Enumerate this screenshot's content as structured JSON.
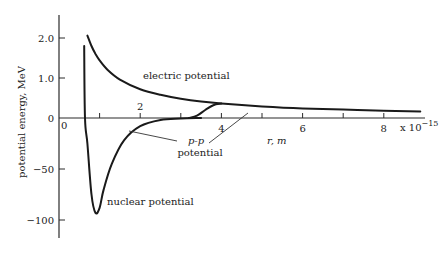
{
  "chart_data": {
    "type": "line",
    "title": "",
    "xlabel": "r, m",
    "x_multiplier": "x 10",
    "x_multiplier_exp": "−15",
    "ylabel": "potential energy, MeV",
    "xlim": [
      0,
      9
    ],
    "x_ticks": [
      1,
      2,
      3,
      4,
      5,
      6,
      7,
      8
    ],
    "x_tick_labels": [
      {
        "value": 0,
        "label": "0"
      },
      {
        "value": 2,
        "label": "2"
      },
      {
        "value": 4,
        "label": "4"
      },
      {
        "value": 6,
        "label": "6"
      },
      {
        "value": 8,
        "label": "8"
      }
    ],
    "y_axis_note": "Broken scale: upper part (0 to 2.0 MeV) expanded, lower part (0 to -100 MeV) compressed",
    "y_ticks_upper": [
      {
        "value": 2.0,
        "label": "2.0"
      },
      {
        "value": 1.0,
        "label": "1.0"
      },
      {
        "value": 0,
        "label": "0"
      }
    ],
    "y_ticks_lower": [
      {
        "value": -50,
        "label": "−50"
      },
      {
        "value": -100,
        "label": "−100"
      }
    ],
    "grid": false,
    "series": [
      {
        "name": "electric potential",
        "x": [
          0.7,
          0.8,
          0.9,
          1.0,
          1.2,
          1.5,
          2.0,
          2.5,
          3.0,
          3.5,
          4.0,
          5.0,
          6.0,
          7.0,
          8.0,
          8.9
        ],
        "y": [
          2.06,
          1.8,
          1.6,
          1.44,
          1.2,
          0.96,
          0.72,
          0.58,
          0.48,
          0.41,
          0.36,
          0.29,
          0.24,
          0.21,
          0.18,
          0.16
        ]
      },
      {
        "name": "nuclear potential",
        "x": [
          0.62,
          0.64,
          0.7,
          0.8,
          0.9,
          1.0,
          1.1,
          1.3,
          1.6,
          2.0,
          2.5,
          3.0,
          3.5
        ],
        "y": [
          1.8,
          0,
          -25,
          -75,
          -93,
          -88,
          -70,
          -45,
          -22,
          -8,
          -2,
          -0.5,
          0
        ]
      },
      {
        "name": "p-p potential",
        "x": [
          3.2,
          3.4,
          3.6,
          3.8,
          4.0
        ],
        "y": [
          0,
          0.06,
          0.2,
          0.32,
          0.36
        ]
      }
    ],
    "annotations": [
      {
        "text": "electric potential",
        "near": "electric curve around r=2.5"
      },
      {
        "text": "nuclear potential",
        "near": "nuclear minimum"
      },
      {
        "text": "p-p",
        "italic": true
      },
      {
        "text": "potential"
      }
    ]
  }
}
